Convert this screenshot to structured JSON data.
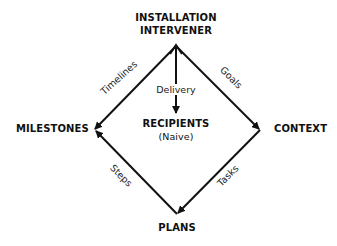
{
  "diagram": {
    "nodes": {
      "top_line1": "INSTALLATION",
      "top_line2": "INTERVENER",
      "left": "MILESTONES",
      "right": "CONTEXT",
      "bottom": "PLANS",
      "center": "RECIPIENTS",
      "center_sub": "(Naive)"
    },
    "edges": {
      "timelines": "Timelines",
      "goals": "Goals",
      "steps": "Steps",
      "tasks": "Tasks",
      "delivery": "Delivery"
    },
    "colors": {
      "line": "#111111",
      "background": "#ffffff"
    }
  }
}
